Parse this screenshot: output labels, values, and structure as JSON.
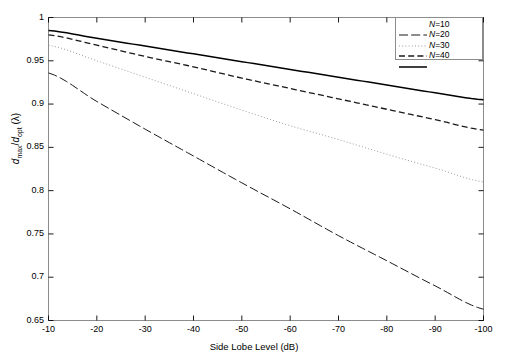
{
  "figure": {
    "background": "#ffffff",
    "axis_color": "#000000",
    "frame_color": "#8c8c8c"
  },
  "axes": {
    "xlabel": "Side Lobe Level (dB)",
    "ylabel_plain": "dmax/dopt (λ)",
    "ylabel_parts": {
      "num_var": "d",
      "num_sub": "max",
      "den_var": "d",
      "den_sub": "opt",
      "unit": "(λ)"
    },
    "xticks": [
      "-10",
      "-20",
      "-30",
      "-40",
      "-50",
      "-60",
      "-70",
      "-80",
      "-90",
      "-100"
    ],
    "yticks": [
      "0.65",
      "0.7",
      "0.75",
      "0.8",
      "0.85",
      "0.9",
      "0.95",
      "1"
    ]
  },
  "legend": {
    "position": "top-right",
    "entries": [
      {
        "label": "N=10",
        "style": "dashdot",
        "color": "#1a1a1a",
        "width": 1.0
      },
      {
        "label": "N=20",
        "style": "dotted",
        "color": "#9a9a9a",
        "width": 1.0
      },
      {
        "label": "N=30",
        "style": "dashed",
        "color": "#1a1a1a",
        "width": 1.3
      },
      {
        "label": "N=40",
        "style": "solid",
        "color": "#000000",
        "width": 1.5
      }
    ]
  },
  "caption_strip": "",
  "chart_data": {
    "type": "line",
    "title": "",
    "xlabel": "Side Lobe Level (dB)",
    "ylabel": "dmax/dopt (λ)",
    "xlim": [
      -10,
      -100
    ],
    "ylim": [
      0.65,
      1.0
    ],
    "grid": false,
    "legend_position": "upper right",
    "x": [
      -10,
      -20,
      -30,
      -40,
      -50,
      -60,
      -70,
      -80,
      -90,
      -100
    ],
    "series": [
      {
        "name": "N=10",
        "style": "dashdot",
        "color": "#1a1a1a",
        "values": [
          0.936,
          0.903,
          0.871,
          0.84,
          0.809,
          0.779,
          0.748,
          0.719,
          0.69,
          0.663
        ]
      },
      {
        "name": "N=20",
        "style": "dotted",
        "color": "#9a9a9a",
        "values": [
          0.968,
          0.95,
          0.931,
          0.912,
          0.893,
          0.875,
          0.859,
          0.842,
          0.826,
          0.81
        ]
      },
      {
        "name": "N=30",
        "style": "dashed",
        "color": "#1a1a1a",
        "values": [
          0.98,
          0.968,
          0.955,
          0.943,
          0.93,
          0.918,
          0.906,
          0.894,
          0.882,
          0.87
        ]
      },
      {
        "name": "N=40",
        "style": "solid",
        "color": "#000000",
        "values": [
          0.985,
          0.976,
          0.967,
          0.958,
          0.949,
          0.94,
          0.931,
          0.922,
          0.913,
          0.905
        ]
      }
    ]
  }
}
